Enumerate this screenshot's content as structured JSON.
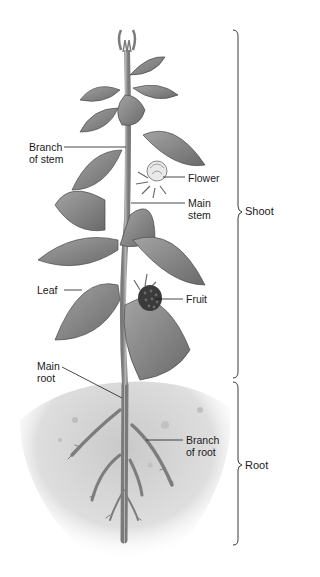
{
  "figure": {
    "colors": {
      "ink": "#1a1a1a",
      "leaf": "#8a8a8a",
      "leaf_dark": "#5e5e5e",
      "soil": "#d4d4d4",
      "stem": "#9a9a9a",
      "fruit": "#3a3a3a"
    }
  },
  "labels": {
    "branch_of_stem": "Branch\nof stem",
    "flower": "Flower",
    "main_stem": "Main\nstem",
    "leaf": "Leaf",
    "fruit": "Fruit",
    "main_root": "Main\nroot",
    "branch_of_root": "Branch\nof root"
  },
  "brackets": {
    "shoot": "Shoot",
    "root": "Root"
  }
}
